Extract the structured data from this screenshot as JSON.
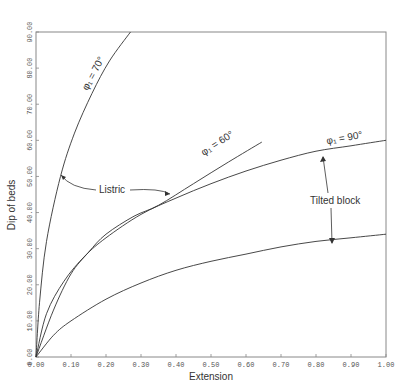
{
  "chart_data": {
    "type": "line",
    "title": "",
    "xlabel": "Extension",
    "ylabel": "Dip of beds",
    "xlim": [
      0,
      1.0
    ],
    "ylim": [
      0,
      90
    ],
    "grid": false,
    "legend": "none (inline curve labels)",
    "x_ticks": [
      "0.00",
      "0.10",
      "0.20",
      "0.30",
      "0.40",
      "0.50",
      "0.60",
      "0.70",
      "0.80",
      "0.90",
      "1.00"
    ],
    "y_ticks": [
      "0.00",
      "10.00",
      "20.00",
      "30.00",
      "40.00",
      "50.00",
      "60.00",
      "70.00",
      "80.00",
      "90.00"
    ],
    "series": [
      {
        "name": "φ1 = 70°",
        "group": "Listric",
        "points": [
          [
            0,
            0
          ],
          [
            0.01,
            15
          ],
          [
            0.03,
            32
          ],
          [
            0.07,
            50
          ],
          [
            0.11,
            62
          ],
          [
            0.16,
            73
          ],
          [
            0.21,
            82
          ],
          [
            0.27,
            90
          ]
        ]
      },
      {
        "name": "φ1 = 60°",
        "group": "Listric",
        "points": [
          [
            0,
            0
          ],
          [
            0.05,
            13
          ],
          [
            0.1,
            23
          ],
          [
            0.15,
            29
          ],
          [
            0.2,
            34
          ],
          [
            0.28,
            39
          ],
          [
            0.35,
            42
          ],
          [
            0.45,
            48
          ],
          [
            0.55,
            54
          ],
          [
            0.645,
            59.5
          ]
        ]
      },
      {
        "name": "φ1 = 90°",
        "group": "Tilted block",
        "points": [
          [
            0,
            0
          ],
          [
            0.03,
            12
          ],
          [
            0.08,
            21
          ],
          [
            0.14,
            28
          ],
          [
            0.2,
            33
          ],
          [
            0.3,
            39.5
          ],
          [
            0.4,
            44
          ],
          [
            0.5,
            48
          ],
          [
            0.6,
            51.5
          ],
          [
            0.7,
            54.5
          ],
          [
            0.8,
            57
          ],
          [
            0.9,
            58.5
          ],
          [
            1.0,
            60
          ]
        ]
      },
      {
        "name": "Tilted block (lower)",
        "group": "Tilted block",
        "points": [
          [
            0,
            0
          ],
          [
            0.05,
            6
          ],
          [
            0.1,
            10
          ],
          [
            0.2,
            16
          ],
          [
            0.3,
            20.5
          ],
          [
            0.4,
            24
          ],
          [
            0.5,
            26.5
          ],
          [
            0.6,
            28.5
          ],
          [
            0.7,
            30.5
          ],
          [
            0.8,
            32
          ],
          [
            0.9,
            33
          ],
          [
            1.0,
            34
          ]
        ]
      }
    ],
    "annotations": [
      {
        "text": "Listric",
        "points_to": [
          "φ1 = 70°",
          "φ1 = 60°"
        ]
      },
      {
        "text": "Tilted block",
        "points_to": [
          "φ1 = 90°",
          "Tilted block (lower)"
        ]
      }
    ]
  },
  "labels": {
    "xlabel": "Extension",
    "ylabel": "Dip of beds",
    "curve70": "φ₁ = 70°",
    "curve60": "φ₁ = 60°",
    "curve90": "φ₁ = 90°",
    "listric": "Listric",
    "tilted": "Tilted block"
  },
  "colors": {
    "line": "#333333",
    "frame": "#777777",
    "text": "#333333"
  }
}
